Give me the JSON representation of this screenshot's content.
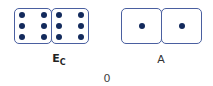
{
  "pairs": [
    {
      "label_main": "E",
      "label_sub": "C",
      "dice": [
        6,
        6
      ]
    },
    {
      "label_main": "A",
      "label_sub": "",
      "dice": [
        1,
        1
      ]
    }
  ],
  "bottom_label": "0",
  "colors": {
    "die_border": "#4a5fa0",
    "pip": "#132a5c"
  }
}
